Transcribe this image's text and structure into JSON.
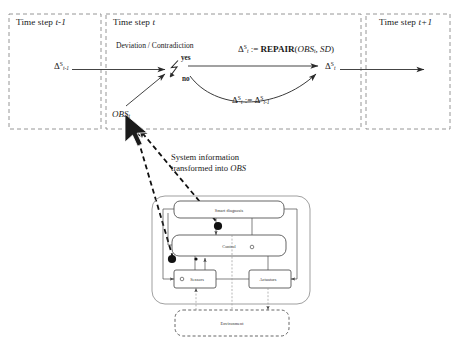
{
  "diagram": {
    "title_panels": [
      {
        "prefix": "Time step ",
        "symbol": "t-1"
      },
      {
        "prefix": "Time step ",
        "symbol": "t"
      },
      {
        "prefix": "Time step ",
        "symbol": "t+1"
      }
    ],
    "decision_label": "Deviation / Contradiction",
    "branch_yes": "yes",
    "branch_no": "no",
    "repair_formula": {
      "lhs_delta": "Δ",
      "lhs_sup": "S",
      "lhs_sub": "t",
      "assign": " := ",
      "fn_name": "REPAIR",
      "arg_open": "(",
      "arg1": "OBS",
      "arg1_sub": "t",
      "arg_sep": ", ",
      "arg2": "SD",
      "arg_close": ")"
    },
    "carryover_formula": {
      "lhs_delta": "Δ",
      "lhs_sup": "S",
      "lhs_sub": "t",
      "assign": " := ",
      "rhs_delta": "Δ",
      "rhs_sup": "S",
      "rhs_sub": "t-1"
    },
    "input_delta": {
      "symbol": "Δ",
      "sup": "S",
      "sub": "t-1"
    },
    "output_delta": {
      "symbol": "Δ",
      "sup": "S",
      "sub": "t"
    },
    "obs_label": {
      "text": "OBS",
      "sub": "t"
    },
    "annotation": {
      "line1": "System information",
      "line2_prefix": "transformed into ",
      "line2_italic": "OBS"
    },
    "system_boxes": [
      {
        "id": "smart-diagnosis",
        "label": "Smart diagnosis"
      },
      {
        "id": "control",
        "label": "Control"
      },
      {
        "id": "sensors",
        "label": "Sensors"
      },
      {
        "id": "actuators",
        "label": "Actuators"
      },
      {
        "id": "environment",
        "label": "Environment"
      }
    ],
    "colors": {
      "line": "#3a3a3a",
      "dashed_frame": "#7a7a7a",
      "box_stroke": "#555555",
      "dot_fill": "#111111",
      "cursor_fill": "#1a1a1a"
    }
  }
}
